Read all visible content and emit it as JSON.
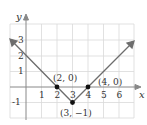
{
  "graph": {
    "function": "y = |x - 3| - 1",
    "axes": {
      "x_label": "x",
      "y_label": "y",
      "x_ticks": [
        "1",
        "2",
        "3",
        "4",
        "5",
        "6"
      ],
      "y_ticks": [
        "3",
        "2",
        "1",
        "-1"
      ],
      "x_range": [
        -1,
        7
      ],
      "y_range": [
        -2,
        4
      ]
    },
    "points": [
      {
        "label": "(2, 0)",
        "x": 2,
        "y": 0
      },
      {
        "label": "(3, −1)",
        "x": 3,
        "y": -1
      },
      {
        "label": "(4, 0)",
        "x": 4,
        "y": 0
      }
    ],
    "colors": {
      "grid": "#d9d9d9",
      "axis": "#888888",
      "graph_line": "#6d6d6d",
      "point": "#111111"
    }
  }
}
